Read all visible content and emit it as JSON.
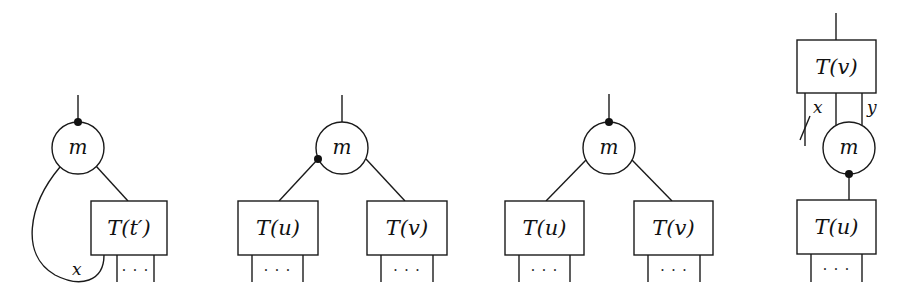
{
  "figure": {
    "colors": {
      "ink": "#1a1a1a",
      "background": "#ffffff"
    },
    "diagrams": [
      {
        "id": "panel-1",
        "node_label": "m",
        "circle": {
          "cx": 78,
          "cy": 148,
          "r": 26
        },
        "dots": [
          {
            "cx": 78,
            "cy": 122
          }
        ],
        "boxes": [
          {
            "label": "T(t′)",
            "x": 91,
            "y": 201,
            "w": 76,
            "h": 54,
            "legs": [
              117,
              154
            ]
          }
        ],
        "wires": [
          {
            "d": "M78 95 L78 122"
          },
          {
            "d": "M96 166 L128 201"
          },
          {
            "d": "M60 167 C 28 205, 20 255, 55 275 C 80 288, 104 282, 104 255"
          }
        ],
        "wire_labels": [
          {
            "text": "x",
            "x": 72,
            "y": 275
          }
        ]
      },
      {
        "id": "panel-2",
        "node_label": "m",
        "circle": {
          "cx": 342,
          "cy": 148,
          "r": 26
        },
        "dots": [
          {
            "cx": 318,
            "cy": 159
          }
        ],
        "boxes": [
          {
            "label": "T(u)",
            "x": 238,
            "y": 201,
            "w": 80,
            "h": 54,
            "legs": [
              252,
              303
            ]
          },
          {
            "label": "T(v)",
            "x": 367,
            "y": 201,
            "w": 80,
            "h": 54,
            "legs": [
              381,
              433
            ]
          }
        ],
        "wires": [
          {
            "d": "M342 95 L342 122"
          },
          {
            "d": "M318 159 L279 201"
          },
          {
            "d": "M366 159 L405 201"
          }
        ],
        "wire_labels": []
      },
      {
        "id": "panel-3",
        "node_label": "m",
        "circle": {
          "cx": 609,
          "cy": 148,
          "r": 26
        },
        "dots": [
          {
            "cx": 609,
            "cy": 122
          }
        ],
        "boxes": [
          {
            "label": "T(u)",
            "x": 505,
            "y": 201,
            "w": 79,
            "h": 54,
            "legs": [
              519,
              570
            ]
          },
          {
            "label": "T(v)",
            "x": 634,
            "y": 201,
            "w": 79,
            "h": 54,
            "legs": [
              648,
              700
            ]
          }
        ],
        "wires": [
          {
            "d": "M609 94 L609 122"
          },
          {
            "d": "M586 160 L546 201"
          },
          {
            "d": "M632 160 L672 201"
          }
        ],
        "wire_labels": []
      },
      {
        "id": "panel-4",
        "node_label": "m",
        "circle": {
          "cx": 849,
          "cy": 148,
          "r": 26
        },
        "dots": [
          {
            "cx": 849,
            "cy": 174
          }
        ],
        "boxes": [
          {
            "label": "T(v)",
            "x": 797,
            "y": 40,
            "w": 79,
            "h": 53,
            "legs": []
          },
          {
            "label": "T(u)",
            "x": 797,
            "y": 200,
            "w": 79,
            "h": 54,
            "legs": [
              811,
              862
            ]
          }
        ],
        "wires": [
          {
            "d": "M836 13 L836 40"
          },
          {
            "d": "M805 93 L805 146"
          },
          {
            "d": "M800 140 L810 116"
          },
          {
            "d": "M836 93 L836 125"
          },
          {
            "d": "M862 93 L862 125"
          },
          {
            "d": "M849 174 L849 200"
          }
        ],
        "wire_labels": [
          {
            "text": "x",
            "x": 813,
            "y": 113
          },
          {
            "text": "y",
            "x": 867,
            "y": 113
          }
        ]
      }
    ],
    "leg_bottom_y": 282,
    "ellipsis": "· · ·"
  }
}
